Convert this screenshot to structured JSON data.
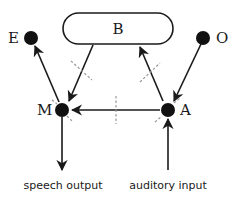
{
  "diagram": {
    "box": {
      "label": "B"
    },
    "nodes": [
      {
        "id": "E",
        "label": "E"
      },
      {
        "id": "O",
        "label": "O"
      },
      {
        "id": "M",
        "label": "M"
      },
      {
        "id": "A",
        "label": "A"
      }
    ],
    "inputs_outputs": {
      "output_label": "speech output",
      "input_label": "auditory input"
    },
    "edges": [
      {
        "from": "B",
        "to": "M",
        "lesion_mark": true
      },
      {
        "from": "A",
        "to": "B",
        "lesion_mark": true
      },
      {
        "from": "O",
        "to": "A",
        "lesion_mark": false
      },
      {
        "from": "M",
        "to": "E",
        "lesion_mark": false
      },
      {
        "from": "A",
        "to": "M",
        "lesion_mark": true
      },
      {
        "from": "M",
        "to": "speech output",
        "lesion_mark": false
      },
      {
        "from": "auditory input",
        "to": "A",
        "lesion_mark": false
      }
    ],
    "colors": {
      "ink": "#1a1a1a",
      "dashed": "#999999"
    }
  }
}
